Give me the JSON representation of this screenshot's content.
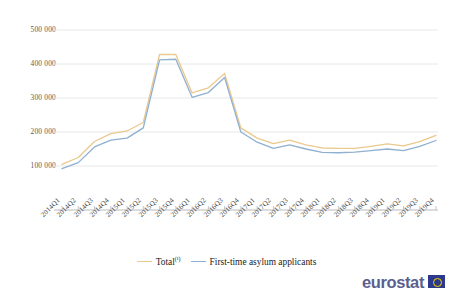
{
  "chart_data": {
    "type": "line",
    "title": "",
    "subtitle": "",
    "xlabel": "",
    "ylabel": "",
    "ylim": [
      0,
      550000
    ],
    "yticks": [
      100000,
      200000,
      300000,
      400000,
      500000
    ],
    "ytick_labels": [
      "100 000",
      "200 000",
      "300 000",
      "400 000",
      "500 000"
    ],
    "grid": "horizontal",
    "legend_position": "bottom",
    "categories": [
      "2014Q1",
      "2014Q2",
      "2014Q3",
      "2014Q4",
      "2015Q1",
      "2015Q2",
      "2015Q3",
      "2015Q4",
      "2016Q1",
      "2016Q2",
      "2016Q3",
      "2016Q4",
      "2017Q1",
      "2017Q2",
      "2017Q3",
      "2017Q4",
      "2018Q1",
      "2018Q2",
      "2018Q3",
      "2018Q4",
      "2019Q1",
      "2019Q2",
      "2019Q3",
      "2019Q4"
    ],
    "series": [
      {
        "name": "Total (¹)",
        "color": "#e9c98d",
        "values": [
          105000,
          125000,
          172000,
          195000,
          203000,
          228000,
          428000,
          428000,
          315000,
          330000,
          372000,
          212000,
          182000,
          166000,
          176000,
          162000,
          153000,
          152000,
          152000,
          158000,
          165000,
          159000,
          172000,
          190000
        ]
      },
      {
        "name": "First-time asylum applicants",
        "color": "#8fb0d0",
        "values": [
          92000,
          110000,
          156000,
          176000,
          182000,
          212000,
          412000,
          414000,
          302000,
          316000,
          360000,
          200000,
          170000,
          152000,
          162000,
          150000,
          140000,
          139000,
          141000,
          145000,
          150000,
          145000,
          158000,
          175000
        ]
      }
    ]
  },
  "legend": {
    "items": [
      {
        "label": "Total",
        "footnote": "(¹)",
        "color": "#e9c98d"
      },
      {
        "label": "First-time asylum applicants",
        "footnote": "",
        "color": "#8fb0d0"
      }
    ]
  },
  "branding": {
    "wordmark": "eurostat",
    "flag_name": "eu-flag-icon"
  },
  "colors": {
    "total_line": "#e9c98d",
    "first_time_line": "#8fb0d0",
    "gridline": "#e8e8ea",
    "axis": "#b9b9bd",
    "tick_text": "#56595e",
    "background": "#ffffff"
  }
}
